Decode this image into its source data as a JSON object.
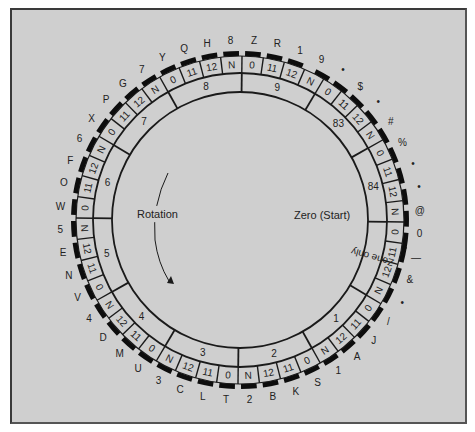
{
  "diagram": {
    "colors": {
      "background": "#cfcfcf",
      "line": "#1a1a1a",
      "bar": "#0d0d0d",
      "text": "#222222"
    },
    "labels": {
      "rotation": "Rotation",
      "zero_start": "Zero (Start)"
    },
    "groups": [
      {
        "band_label": "9",
        "cells": [
          "0",
          "11",
          "12",
          "N"
        ],
        "outer": [
          "Z",
          "R",
          "1",
          "9"
        ]
      },
      {
        "band_label": "83",
        "cells": [
          "0",
          "11",
          "12",
          "N"
        ],
        "outer": [
          "•",
          "$",
          "•",
          "#"
        ]
      },
      {
        "band_label": "84",
        "cells": [
          "0",
          "11",
          "12",
          "N"
        ],
        "outer": [
          "%",
          "•",
          "•",
          "@"
        ]
      },
      {
        "band_label": "Zone only",
        "cells": [
          "0",
          "11",
          "12",
          "N"
        ],
        "outer": [
          "0",
          "—",
          "&",
          "•"
        ]
      },
      {
        "band_label": "1",
        "cells": [
          "0",
          "11",
          "12",
          "N"
        ],
        "outer": [
          "/",
          "J",
          "A",
          "1"
        ]
      },
      {
        "band_label": "2",
        "cells": [
          "0",
          "11",
          "12",
          "N"
        ],
        "outer": [
          "S",
          "K",
          "B",
          "2"
        ]
      },
      {
        "band_label": "3",
        "cells": [
          "0",
          "11",
          "12",
          "N"
        ],
        "outer": [
          "T",
          "L",
          "C",
          "3"
        ]
      },
      {
        "band_label": "4",
        "cells": [
          "0",
          "11",
          "12",
          "N"
        ],
        "outer": [
          "U",
          "M",
          "D",
          "4"
        ]
      },
      {
        "band_label": "5",
        "cells": [
          "0",
          "11",
          "12",
          "N"
        ],
        "outer": [
          "V",
          "N",
          "E",
          "5"
        ]
      },
      {
        "band_label": "6",
        "cells": [
          "0",
          "11",
          "12",
          "N"
        ],
        "outer": [
          "W",
          "O",
          "F",
          "6"
        ]
      },
      {
        "band_label": "7",
        "cells": [
          "0",
          "11",
          "12",
          "N"
        ],
        "outer": [
          "X",
          "P",
          "G",
          "7"
        ]
      },
      {
        "band_label": "8",
        "cells": [
          "0",
          "11",
          "12",
          "N"
        ],
        "outer": [
          "Y",
          "Q",
          "H",
          "8"
        ]
      }
    ]
  }
}
